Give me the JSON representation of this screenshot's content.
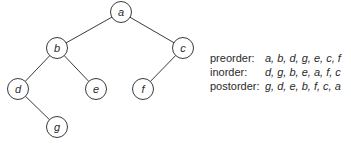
{
  "tree": {
    "nodes": [
      {
        "id": "a",
        "label": "a",
        "x": 121,
        "y": 12
      },
      {
        "id": "b",
        "label": "b",
        "x": 57,
        "y": 48
      },
      {
        "id": "c",
        "label": "c",
        "x": 183,
        "y": 48
      },
      {
        "id": "d",
        "label": "d",
        "x": 18,
        "y": 89
      },
      {
        "id": "e",
        "label": "e",
        "x": 96,
        "y": 89
      },
      {
        "id": "f",
        "label": "f",
        "x": 143,
        "y": 89
      },
      {
        "id": "g",
        "label": "g",
        "x": 57,
        "y": 127
      }
    ],
    "edges": [
      [
        "a",
        "b"
      ],
      [
        "a",
        "c"
      ],
      [
        "b",
        "d"
      ],
      [
        "b",
        "e"
      ],
      [
        "c",
        "f"
      ],
      [
        "d",
        "g"
      ]
    ],
    "node_radius": 10.5
  },
  "traversals": [
    {
      "label": "preorder:",
      "value": "a, b, d, g, e, c, f"
    },
    {
      "label": "inorder:",
      "value": "d, g, b, e, a, f, c"
    },
    {
      "label": "postorder:",
      "value": "g, d, e, b, f, c, a"
    }
  ]
}
